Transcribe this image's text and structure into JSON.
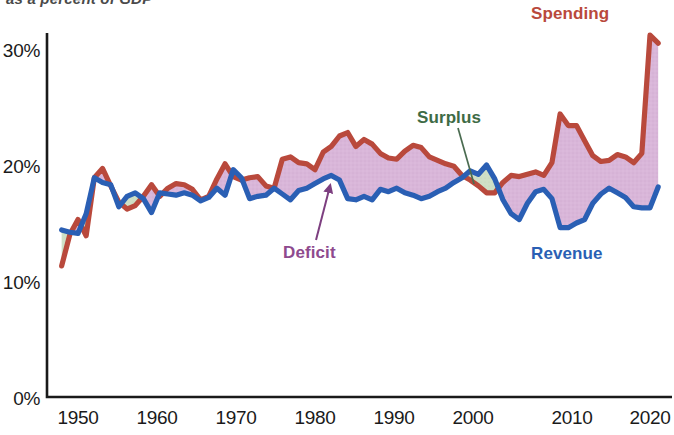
{
  "subtitle": "as a percent of GDP",
  "axes": {
    "y_ticks": [
      "0%",
      "10%",
      "20%",
      "30%"
    ],
    "x_ticks": [
      "1950",
      "1960",
      "1970",
      "1980",
      "1990",
      "2000",
      "2010",
      "2020"
    ]
  },
  "annotations": {
    "spending": "Spending",
    "revenue": "Revenue",
    "deficit": "Deficit",
    "surplus": "Surplus"
  },
  "colors": {
    "spending": "#b9493c",
    "revenue": "#2a5fb4",
    "deficit_fill": "#d9b6d9",
    "surplus_fill": "#cfe0c6",
    "axis": "#1a1a1a"
  },
  "chart_data": {
    "type": "area",
    "title": "",
    "subtitle": "as a percent of GDP",
    "xlabel": "",
    "ylabel": "",
    "xlim": [
      1948,
      2022
    ],
    "ylim": [
      0,
      33
    ],
    "y_tick_values": [
      0,
      10,
      20,
      30
    ],
    "x_tick_values": [
      1950,
      1960,
      1970,
      1980,
      1990,
      2000,
      2010,
      2020
    ],
    "grid": false,
    "legend": "inline-annotations",
    "x": [
      1948,
      1949,
      1950,
      1951,
      1952,
      1953,
      1954,
      1955,
      1956,
      1957,
      1958,
      1959,
      1960,
      1961,
      1962,
      1963,
      1964,
      1965,
      1966,
      1967,
      1968,
      1969,
      1970,
      1971,
      1972,
      1973,
      1974,
      1975,
      1976,
      1977,
      1978,
      1979,
      1980,
      1981,
      1982,
      1983,
      1984,
      1985,
      1986,
      1987,
      1988,
      1989,
      1990,
      1991,
      1992,
      1993,
      1994,
      1995,
      1996,
      1997,
      1998,
      1999,
      2000,
      2001,
      2002,
      2003,
      2004,
      2005,
      2006,
      2007,
      2008,
      2009,
      2010,
      2011,
      2012,
      2013,
      2014,
      2015,
      2016,
      2017,
      2018,
      2019,
      2020,
      2021
    ],
    "series": [
      {
        "name": "Spending",
        "color": "#b9493c",
        "values": [
          11.3,
          14.0,
          15.3,
          13.9,
          18.9,
          19.7,
          18.2,
          16.8,
          16.2,
          16.5,
          17.3,
          18.3,
          17.3,
          18.0,
          18.4,
          18.3,
          17.9,
          17.0,
          17.3,
          18.8,
          20.1,
          19.0,
          18.7,
          18.9,
          19.0,
          18.2,
          18.0,
          20.5,
          20.7,
          20.2,
          20.1,
          19.6,
          21.1,
          21.6,
          22.5,
          22.8,
          21.6,
          22.2,
          21.8,
          21.0,
          20.6,
          20.5,
          21.2,
          21.7,
          21.5,
          20.7,
          20.4,
          20.1,
          19.9,
          19.1,
          18.7,
          18.2,
          17.6,
          17.6,
          18.5,
          19.1,
          19.0,
          19.2,
          19.4,
          19.1,
          20.2,
          24.4,
          23.4,
          23.4,
          22.1,
          20.8,
          20.3,
          20.4,
          20.9,
          20.7,
          20.2,
          21.0,
          31.2,
          30.5
        ]
      },
      {
        "name": "Revenue",
        "color": "#2a5fb4",
        "values": [
          14.4,
          14.2,
          14.1,
          15.8,
          18.9,
          18.5,
          18.3,
          16.4,
          17.3,
          17.6,
          17.1,
          15.9,
          17.6,
          17.5,
          17.4,
          17.6,
          17.4,
          16.9,
          17.2,
          18.0,
          17.4,
          19.6,
          18.9,
          17.1,
          17.3,
          17.4,
          18.0,
          17.5,
          17.0,
          17.8,
          18.0,
          18.4,
          18.8,
          19.1,
          18.7,
          17.1,
          17.0,
          17.3,
          17.0,
          17.9,
          17.7,
          18.0,
          17.6,
          17.4,
          17.1,
          17.3,
          17.7,
          18.0,
          18.5,
          18.9,
          19.5,
          19.2,
          20.0,
          18.8,
          17.0,
          15.8,
          15.3,
          16.7,
          17.7,
          17.9,
          17.1,
          14.6,
          14.6,
          15.0,
          15.3,
          16.7,
          17.5,
          18.0,
          17.6,
          17.2,
          16.4,
          16.3,
          16.3,
          18.1
        ]
      }
    ],
    "annotations": [
      {
        "label": "Spending",
        "color": "#b9493c",
        "points_to_year": 2020
      },
      {
        "label": "Revenue",
        "color": "#2a5fb4",
        "points_to_year": 2016
      },
      {
        "label": "Deficit",
        "color": "#8e4a8e",
        "points_to_year": 1984,
        "description": "mauve fill where spending exceeds revenue"
      },
      {
        "label": "Surplus",
        "color": "#3e6b45",
        "points_to_year": 2000,
        "description": "green fill where revenue exceeds spending"
      }
    ]
  }
}
